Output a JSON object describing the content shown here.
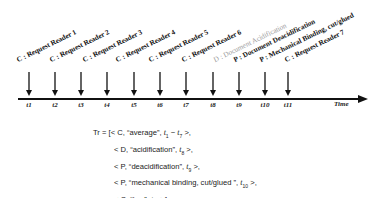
{
  "diagram": {
    "type": "timeline",
    "axis_label": "Time",
    "events": [
      {
        "tick": "t1",
        "label": "C : Request Reader 1",
        "style": "bold"
      },
      {
        "tick": "t2",
        "label": "C : Request Reader 2",
        "style": "bold"
      },
      {
        "tick": "t3",
        "label": "C : Request Reader 3",
        "style": "bold"
      },
      {
        "tick": "t4",
        "label": "C : Request Reader 4",
        "style": "bold"
      },
      {
        "tick": "t5",
        "label": "C : Request Reader 5",
        "style": "bold"
      },
      {
        "tick": "t6",
        "label": "C : Request Reader 6",
        "style": "bold"
      },
      {
        "tick": "t7",
        "label": "",
        "style": "bold"
      },
      {
        "tick": "t8",
        "label": "D : Document Acidification",
        "style": "gray"
      },
      {
        "tick": "t9",
        "label": "P : Document Deacidification",
        "style": "bold"
      },
      {
        "tick": "t10",
        "label": "P : Mechanical Binding, cut/glued",
        "style": "bold"
      },
      {
        "tick": "t11",
        "label": "C : Request Reader 7",
        "style": "bold"
      }
    ],
    "colors": {
      "line": "#111111",
      "text": "#111111",
      "gray_label": "#9a9a9a"
    }
  },
  "formula": {
    "lhs": "Tr = [",
    "rows": [
      {
        "open": "< C, “average”, ",
        "t": "t",
        "sub": "1",
        "mid": " − ",
        "t2": "t",
        "sub2": "7",
        "close": " >,"
      },
      {
        "open": "< D, “acidification”, ",
        "t": "t",
        "sub": "8",
        "close": " >,"
      },
      {
        "open": "< P, “deacidification”, ",
        "t": "t",
        "sub": "9",
        "close": " >,"
      },
      {
        "open": "< P, “mechanical binding, cut/glued ”, ",
        "t": "t",
        "sub": "10",
        "close": " >,"
      },
      {
        "open": "< C, “low”, ",
        "t": "t",
        "sub": "11",
        "close": " >]"
      }
    ]
  }
}
